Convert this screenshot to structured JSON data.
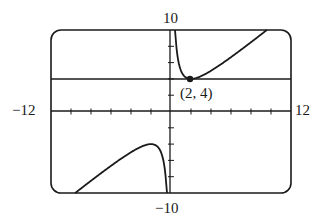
{
  "chart_data": {
    "type": "line",
    "title": "",
    "xlabel": "",
    "ylabel": "",
    "xlim": [
      -12,
      12
    ],
    "ylim": [
      -10,
      10
    ],
    "xtick_step": 2,
    "ytick_step": 2,
    "grid": false,
    "window_labels": {
      "xmin": "−12",
      "xmax": "12",
      "ymin": "−10",
      "ymax": "10"
    },
    "series": [
      {
        "name": "f(x) = x + 4/x",
        "branch": "x > 0",
        "x": [
          0.4,
          0.5,
          1,
          1.5,
          2,
          3,
          4,
          5,
          6,
          7,
          8,
          9,
          9.6
        ],
        "y": [
          10.4,
          8.5,
          5,
          4.17,
          4,
          4.33,
          5,
          5.8,
          6.67,
          7.57,
          8.5,
          9.44,
          10
        ]
      },
      {
        "name": "f(x) = x + 4/x",
        "branch": "x < 0",
        "x": [
          -9.6,
          -9,
          -8,
          -7,
          -6,
          -5,
          -4,
          -3,
          -2,
          -1.5,
          -1,
          -0.5,
          -0.4
        ],
        "y": [
          -10,
          -9.44,
          -8.5,
          -7.57,
          -6.67,
          -5.8,
          -5,
          -4.33,
          -4,
          -4.17,
          -5,
          -8.5,
          -10.4
        ]
      }
    ],
    "reference_lines": [
      {
        "type": "horizontal",
        "y": 4
      }
    ],
    "annotations": [
      {
        "label": "(2, 4)",
        "x": 2,
        "y": 4,
        "marker": "filled-dot"
      }
    ]
  },
  "labels": {
    "ymax": "10",
    "ymin": "−10",
    "xmin": "−12",
    "xmax": "12",
    "point": "(2, 4)"
  }
}
